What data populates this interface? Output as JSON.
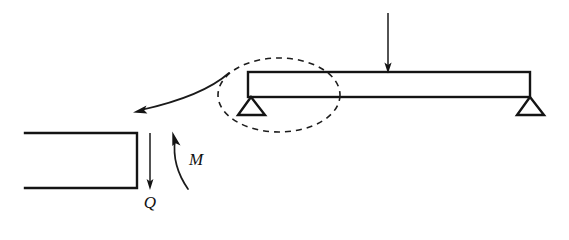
{
  "figure": {
    "type": "engineering-free-body-diagram",
    "title": "",
    "background_color": "#ffffff",
    "line_color": "#141414",
    "width": 569,
    "height": 240
  },
  "beam": {
    "name": "simply-supported-beam",
    "left_x": 248,
    "right_x": 530,
    "top_y": 72,
    "bottom_y": 97,
    "description": "horizontal rectangular beam"
  },
  "supports": [
    {
      "name": "left-pin-support",
      "apex_x": 251,
      "apex_y": 97,
      "base_left_x": 238,
      "base_right_x": 265,
      "base_y": 115,
      "shape": "triangle"
    },
    {
      "name": "right-pin-support",
      "apex_x": 530,
      "apex_y": 97,
      "base_left_x": 517,
      "base_right_x": 544,
      "base_y": 115,
      "shape": "triangle"
    }
  ],
  "load": {
    "name": "point-load-arrow",
    "x": 388,
    "start_y": 13,
    "end_y": 71,
    "direction": "down",
    "label": ""
  },
  "highlight": {
    "name": "detail-ellipse",
    "center_x": 279,
    "center_y": 95,
    "radius_x": 61,
    "radius_y": 37,
    "style": "dashed"
  },
  "callout": {
    "name": "detail-callout-arrow",
    "from_x": 228,
    "from_y": 74,
    "to_x": 134,
    "to_y": 112,
    "style": "curved"
  },
  "free_body": {
    "name": "cut-section-free-body",
    "left_x": 25,
    "right_x": 137,
    "top_y": 133,
    "bottom_y": 188,
    "open_side": "left"
  },
  "forces": [
    {
      "name": "shear-force",
      "label": "Q",
      "symbol": "Q",
      "arrow_x": 150,
      "arrow_start_y": 133,
      "arrow_end_y": 189,
      "direction": "down",
      "label_x": 150,
      "label_y": 206
    },
    {
      "name": "bending-moment",
      "label": "M",
      "symbol": "M",
      "arc_start_x": 188,
      "arc_start_y": 189,
      "arc_end_x": 173,
      "arc_end_y": 134,
      "direction": "counterclockwise",
      "label_x": 196,
      "label_y": 163
    }
  ],
  "labels": {
    "shear": "Q",
    "moment": "M"
  }
}
